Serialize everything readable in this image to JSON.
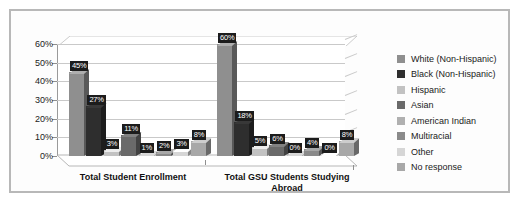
{
  "chart_data": {
    "type": "bar",
    "title": "",
    "xlabel": "",
    "ylabel": "",
    "ylim": [
      0,
      60
    ],
    "ytick_labels": [
      "0%",
      "10%",
      "20%",
      "30%",
      "40%",
      "50%",
      "60%"
    ],
    "ytick_values": [
      0,
      10,
      20,
      30,
      40,
      50,
      60
    ],
    "grid": true,
    "legend_position": "right",
    "categories": [
      "Total Student Enrollment",
      "Total GSU Students Studying Abroad"
    ],
    "series": [
      {
        "name": "White (Non-Hispanic)",
        "color": "#8f8f8f",
        "values": [
          45,
          60
        ],
        "labels": [
          "45%",
          "60%"
        ]
      },
      {
        "name": "Black (Non-Hispanic)",
        "color": "#2e2e2e",
        "values": [
          27,
          18
        ],
        "labels": [
          "27%",
          "18%"
        ]
      },
      {
        "name": "Hispanic",
        "color": "#c2c2c2",
        "values": [
          3,
          5
        ],
        "labels": [
          "3%",
          "5%"
        ]
      },
      {
        "name": "Asian",
        "color": "#6a6a6a",
        "values": [
          11,
          6
        ],
        "labels": [
          "11%",
          "6%"
        ]
      },
      {
        "name": "American Indian",
        "color": "#b0b0b0",
        "values": [
          1,
          0
        ],
        "labels": [
          "1%",
          "0%"
        ]
      },
      {
        "name": "Multiracial",
        "color": "#8a8a8a",
        "values": [
          2,
          4
        ],
        "labels": [
          "2%",
          "4%"
        ]
      },
      {
        "name": "Other",
        "color": "#d6d6d6",
        "values": [
          3,
          0
        ],
        "labels": [
          "3%",
          "0%"
        ]
      },
      {
        "name": "No response",
        "color": "#a8a8a8",
        "values": [
          8,
          8
        ],
        "labels": [
          "8%",
          "8%"
        ]
      }
    ]
  },
  "legend": {
    "items": [
      "White (Non-Hispanic)",
      "Black (Non-Hispanic)",
      "Hispanic",
      "Asian",
      "American Indian",
      "Multiracial",
      "Other",
      "No response"
    ]
  },
  "axis": {
    "y_labels": [
      "60%",
      "50%",
      "40%",
      "30%",
      "20%",
      "10%",
      "0%"
    ]
  },
  "categories": {
    "first": "Total Student Enrollment",
    "second_line1": "Total GSU Students Studying",
    "second_line2": "Abroad"
  }
}
